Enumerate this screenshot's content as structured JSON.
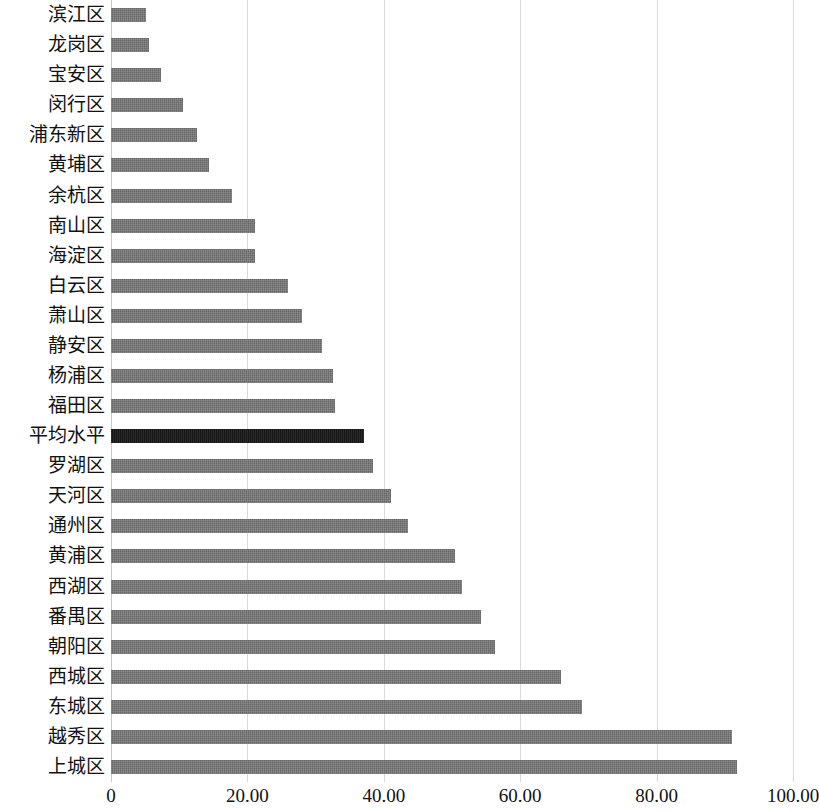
{
  "chart_data": {
    "type": "bar",
    "orientation": "horizontal",
    "title": "",
    "subtitle": "",
    "xlabel": "",
    "ylabel": "",
    "xlim": [
      0,
      100
    ],
    "ylim": null,
    "grid": true,
    "legend": null,
    "xticks": [
      "0",
      "20.00",
      "40.00",
      "60.00",
      "80.00",
      "100.00"
    ],
    "xtick_values": [
      0,
      20,
      40,
      60,
      80,
      100
    ],
    "categories": [
      "滨江区",
      "龙岗区",
      "宝安区",
      "闵行区",
      "浦东新区",
      "黄埔区",
      "余杭区",
      "南山区",
      "海淀区",
      "白云区",
      "萧山区",
      "静安区",
      "杨浦区",
      "福田区",
      "平均水平",
      "罗湖区",
      "天河区",
      "通州区",
      "黄浦区",
      "西湖区",
      "番禺区",
      "朝阳区",
      "西城区",
      "东城区",
      "越秀区",
      "上城区"
    ],
    "values": [
      5.1,
      5.6,
      7.3,
      10.5,
      12.6,
      14.4,
      17.7,
      21.1,
      21.1,
      26.0,
      28.0,
      30.9,
      32.5,
      32.8,
      37.1,
      38.4,
      41.0,
      43.5,
      50.5,
      51.4,
      54.2,
      56.3,
      66.0,
      69.1,
      91.0,
      91.8
    ],
    "highlight_category": "平均水平",
    "highlight_index": 14,
    "colors": {
      "bar": "#737373",
      "highlight_bar": "#1a1a1a",
      "gridline": "#d9d9d9",
      "text": "#111111",
      "background": "#ffffff"
    }
  }
}
